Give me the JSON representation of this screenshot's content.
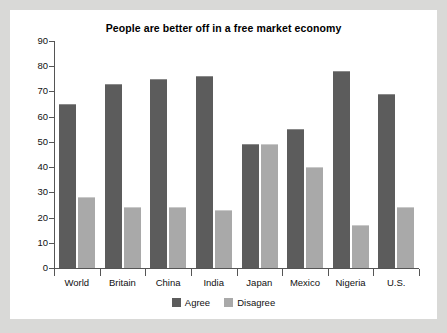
{
  "chart_data": {
    "type": "bar",
    "title": "People are better off in a free market economy",
    "xlabel": "",
    "ylabel": "",
    "ylim": [
      0,
      90
    ],
    "ytick_step": 10,
    "yticks": [
      0,
      10,
      20,
      30,
      40,
      50,
      60,
      70,
      80,
      90
    ],
    "grid": false,
    "legend_position": "bottom-center",
    "categories": [
      "World",
      "Britain",
      "China",
      "India",
      "Japan",
      "Mexico",
      "Nigeria",
      "U.S."
    ],
    "series": [
      {
        "name": "Agree",
        "color": "#5c5c5c",
        "values": [
          65,
          73,
          75,
          76,
          49,
          55,
          78,
          69
        ]
      },
      {
        "name": "Disagree",
        "color": "#a9a9a9",
        "values": [
          28,
          24,
          24,
          23,
          49,
          40,
          17,
          24
        ]
      }
    ]
  },
  "legend": {
    "items": [
      {
        "label": "Agree",
        "color": "#5c5c5c"
      },
      {
        "label": "Disagree",
        "color": "#a9a9a9"
      }
    ]
  },
  "colors": {
    "page_background": "#d9d9d7",
    "panel_background": "#ffffff",
    "axis": "#555555",
    "text": "#111111",
    "agree": "#5c5c5c",
    "disagree": "#a9a9a9"
  }
}
